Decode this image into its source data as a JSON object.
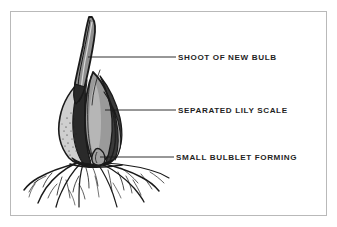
{
  "figure": {
    "background_color": "#ffffff",
    "frame_color": "#b9b9b9",
    "ink_color": "#1a1a1a",
    "fill_gray": "#9a9a9a",
    "fill_gray_light": "#b0b0b0",
    "fill_gray_dark": "#6e6e6e"
  },
  "callouts": [
    {
      "id": "shoot",
      "label": "SHOOT OF NEW BULB",
      "leader_from": [
        88,
        57
      ],
      "leader_to": [
        175,
        57
      ]
    },
    {
      "id": "scale",
      "label": "SEPARATED LILY SCALE",
      "leader_from": [
        105,
        110
      ],
      "leader_to": [
        175,
        110
      ]
    },
    {
      "id": "bulblet",
      "label": "SMALL BULBLET FORMING",
      "leader_from": [
        100,
        157
      ],
      "leader_to": [
        173,
        157
      ]
    }
  ],
  "illustration": {
    "subject": "lily bulb with emerging shoot, separated scale, bulblet and root system",
    "parts": [
      "shoot-new-bulb",
      "separated-lily-scale",
      "small-bulblet",
      "bulb-body",
      "basal-plate",
      "root-system"
    ]
  }
}
